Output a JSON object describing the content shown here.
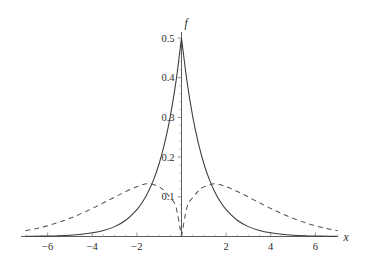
{
  "figure": {
    "background_color": "#ffffff",
    "axis_color": "#4a4a4a",
    "solid_color": "#3a3a3a",
    "dashed_color": "#555555"
  },
  "axes": {
    "x_axis_label": "x",
    "y_axis_label": "f",
    "x_ticks": [
      {
        "value": -6,
        "label": "−6"
      },
      {
        "value": -4,
        "label": "−4"
      },
      {
        "value": -2,
        "label": "−2"
      },
      {
        "value": 2,
        "label": "2"
      },
      {
        "value": 4,
        "label": "4"
      },
      {
        "value": 6,
        "label": "6"
      }
    ],
    "y_ticks": [
      {
        "value": 0.1,
        "label": "0.1"
      },
      {
        "value": 0.2,
        "label": "0.2"
      },
      {
        "value": 0.3,
        "label": "0.3"
      },
      {
        "value": 0.4,
        "label": "0.4"
      },
      {
        "value": 0.5,
        "label": "0.5"
      }
    ]
  },
  "chart_data": {
    "type": "line",
    "title": "",
    "xlabel": "x",
    "ylabel": "f",
    "xlim": [
      -7.2,
      7.0
    ],
    "ylim": [
      0,
      0.52
    ],
    "grid": false,
    "legend": "none",
    "x_tick_labels": [
      "−6",
      "−4",
      "−2",
      "2",
      "4",
      "6"
    ],
    "x_tick_values": [
      -6,
      -4,
      -2,
      2,
      4,
      6
    ],
    "y_tick_labels": [
      "0.1",
      "0.2",
      "0.3",
      "0.4",
      "0.5"
    ],
    "y_tick_values": [
      0.1,
      0.2,
      0.3,
      0.4,
      0.5
    ],
    "series": [
      {
        "name": "solid-curve",
        "style": "solid",
        "description": "Laplace density peaking at 0.5 at x = 0",
        "peak_x": 0,
        "peak_y": 0.5,
        "x": [
          -7.0,
          -6.5,
          -6.0,
          -5.5,
          -5.0,
          -4.5,
          -4.0,
          -3.5,
          -3.0,
          -2.5,
          -2.0,
          -1.75,
          -1.5,
          -1.25,
          -1.0,
          -0.75,
          -0.5,
          -0.25,
          0.0,
          0.25,
          0.5,
          0.75,
          1.0,
          1.25,
          1.5,
          1.75,
          2.0,
          2.5,
          3.0,
          3.5,
          4.0,
          4.5,
          5.0,
          5.5,
          6.0,
          6.5,
          7.0
        ],
        "y": [
          0.0005,
          0.0008,
          0.0012,
          0.002,
          0.0034,
          0.0056,
          0.0092,
          0.0151,
          0.0249,
          0.041,
          0.0677,
          0.0869,
          0.1116,
          0.1433,
          0.1839,
          0.2362,
          0.3033,
          0.3894,
          0.5,
          0.3894,
          0.3033,
          0.2362,
          0.1839,
          0.1433,
          0.1116,
          0.0869,
          0.0677,
          0.041,
          0.0249,
          0.0151,
          0.0092,
          0.0056,
          0.0034,
          0.002,
          0.0012,
          0.0008,
          0.0005
        ]
      },
      {
        "name": "dashed-curve",
        "style": "dashed",
        "description": "Bimodal density, zero at x = 0, peaks near x = ±2",
        "peak_x": 2,
        "peak_y": 0.132,
        "x": [
          -7.0,
          -6.5,
          -6.0,
          -5.5,
          -5.0,
          -4.5,
          -4.0,
          -3.5,
          -3.0,
          -2.5,
          -2.0,
          -1.5,
          -1.0,
          -0.75,
          -0.5,
          -0.25,
          0.0,
          0.25,
          0.5,
          0.75,
          1.0,
          1.5,
          2.0,
          2.5,
          3.0,
          3.5,
          4.0,
          4.5,
          5.0,
          5.5,
          6.0,
          6.5,
          7.0
        ],
        "y": [
          0.0147,
          0.0202,
          0.0271,
          0.0357,
          0.0458,
          0.0576,
          0.0707,
          0.0848,
          0.0993,
          0.1133,
          0.1254,
          0.1328,
          0.125,
          0.114,
          0.0975,
          0.0747,
          0.0,
          0.0747,
          0.0975,
          0.114,
          0.125,
          0.1328,
          0.1254,
          0.1133,
          0.0993,
          0.0848,
          0.0707,
          0.0576,
          0.0458,
          0.0357,
          0.0271,
          0.0202,
          0.0147
        ]
      }
    ]
  }
}
